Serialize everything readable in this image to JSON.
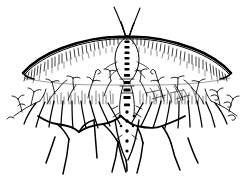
{
  "figure": {
    "title": "Moth specimen line drawing",
    "style": "pen-and-ink scientific illustration",
    "canvas": {
      "width": 251,
      "height": 185
    },
    "colors": {
      "ink": "#000000",
      "background": "#ffffff"
    },
    "parts": [
      {
        "name": "antennae",
        "label": "Antennae",
        "count": 2
      },
      {
        "name": "head",
        "label": "Head"
      },
      {
        "name": "thorax",
        "label": "Thorax"
      },
      {
        "name": "abdomen",
        "label": "Abdomen (segmented)",
        "segments": 11
      },
      {
        "name": "forewing-left",
        "label": "Left forewing"
      },
      {
        "name": "forewing-right",
        "label": "Right forewing"
      },
      {
        "name": "wing-costal-margin",
        "label": "Costal margin (dark leading edge)"
      },
      {
        "name": "wing-hatching",
        "label": "Wing surface hatching"
      },
      {
        "name": "hindwing-lobes",
        "label": "Scalloped hindwing lobes",
        "count": 5
      },
      {
        "name": "wing-veins",
        "label": "Radiating wing veins",
        "count": 22
      },
      {
        "name": "plumose-scales",
        "label": "Branched plumose scales"
      }
    ]
  },
  "geometry": {
    "antenna_left": "M126,36 L115,8",
    "antenna_right": "M128,36 L140,9",
    "body_axis_x": 127,
    "body_top_y": 34,
    "body_bottom_y": 168,
    "thorax_outline_left": "M126,36 C117,42 114,54 117,66 C119,74 123,79 126,82",
    "thorax_outline_right": "M129,36 C138,42 141,54 138,66 C136,74 132,79 129,82",
    "costal_left": "M127,37 C103,37 72,44 48,56 C36,62 28,68 23,74",
    "costal_right": "M127,37 C151,37 182,44 206,56 C218,62 226,68 231,74",
    "lower_margin_left": "M23,74 C34,78 58,81 88,82 C104,83 118,83 127,83",
    "lower_margin_right": "M231,74 C220,78 196,81 166,82 C150,83 136,83 127,83",
    "hatch_band_y": [
      84,
      108
    ],
    "lobe_baseline_y": 125,
    "lobe_apex_ys": [
      124,
      128,
      133,
      128,
      124
    ],
    "lobe_centers_x": [
      58,
      92,
      127,
      162,
      196
    ],
    "fringe_tip_ys": [
      180,
      176,
      172,
      176,
      180
    ]
  },
  "abdomen_segments": [
    {
      "index": 1,
      "y": 42
    },
    {
      "index": 2,
      "y": 48
    },
    {
      "index": 3,
      "y": 54
    },
    {
      "index": 4,
      "y": 60
    },
    {
      "index": 5,
      "y": 66
    },
    {
      "index": 6,
      "y": 72
    },
    {
      "index": 7,
      "y": 79
    },
    {
      "index": 8,
      "y": 86
    },
    {
      "index": 9,
      "y": 93
    },
    {
      "index": 10,
      "y": 100
    },
    {
      "index": 11,
      "y": 107
    }
  ]
}
